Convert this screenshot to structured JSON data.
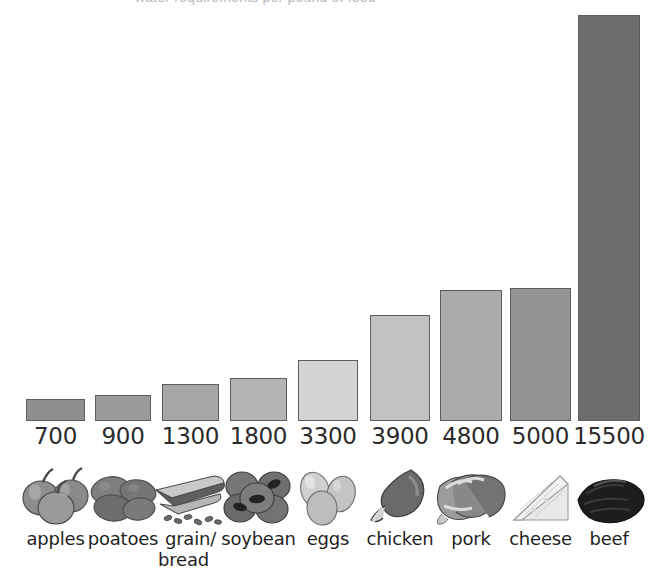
{
  "title": "water requirements per pound of food",
  "chart_data": {
    "type": "bar",
    "title": "water requirements per pound of food",
    "xlabel": "",
    "ylabel": "",
    "ylim": [
      0,
      15500
    ],
    "grid": false,
    "legend": "none",
    "categories": [
      "apples",
      "poatoes",
      "grain/\nbread",
      "soybean",
      "eggs",
      "chicken",
      "pork",
      "cheese",
      "beef"
    ],
    "values": [
      700,
      900,
      1300,
      1800,
      3300,
      3900,
      4800,
      5000,
      15500
    ],
    "value_labels": [
      "700",
      "900",
      "1300",
      "1800",
      "3300",
      "3900",
      "4800",
      "5000",
      "15500"
    ]
  },
  "bars": [
    {
      "label": "apples",
      "label_line1": "apples",
      "label_line2": "",
      "value": 700,
      "value_label": "700",
      "icon": "apples-icon",
      "color": "#8f8f8f"
    },
    {
      "label": "poatoes",
      "label_line1": "poatoes",
      "label_line2": "",
      "value": 900,
      "value_label": "900",
      "icon": "potatoes-icon",
      "color": "#9b9b9b"
    },
    {
      "label": "grain/bread",
      "label_line1": "grain/",
      "label_line2": "bread",
      "value": 1300,
      "value_label": "1300",
      "icon": "bread-icon",
      "color": "#a6a6a6"
    },
    {
      "label": "soybean",
      "label_line1": "soybean",
      "label_line2": "",
      "value": 1800,
      "value_label": "1800",
      "icon": "soybean-icon",
      "color": "#b4b4b4"
    },
    {
      "label": "eggs",
      "label_line1": "eggs",
      "label_line2": "",
      "value": 3300,
      "value_label": "3300",
      "icon": "eggs-icon",
      "color": "#d4d4d4"
    },
    {
      "label": "chicken",
      "label_line1": "chicken",
      "label_line2": "",
      "value": 3900,
      "value_label": "3900",
      "icon": "chicken-icon",
      "color": "#c2c2c2"
    },
    {
      "label": "pork",
      "label_line1": "pork",
      "label_line2": "",
      "value": 4800,
      "value_label": "4800",
      "icon": "pork-icon",
      "color": "#ababab"
    },
    {
      "label": "cheese",
      "label_line1": "cheese",
      "label_line2": "",
      "value": 5000,
      "value_label": "5000",
      "icon": "cheese-icon",
      "color": "#949494"
    },
    {
      "label": "beef",
      "label_line1": "beef",
      "label_line2": "",
      "value": 15500,
      "value_label": "15500",
      "icon": "beef-icon",
      "color": "#6d6d6d"
    }
  ],
  "colors": {
    "background": "#ffffff",
    "bar_outline": "#5d5d5d",
    "text": "#1f1f1f",
    "value_text": "#2b2b2b"
  }
}
